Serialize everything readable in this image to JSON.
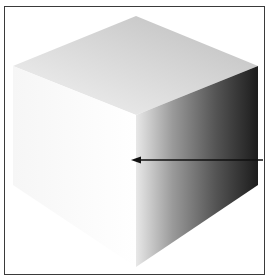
{
  "figure": {
    "faces": {
      "top": {
        "color_light": "#ececec",
        "color_dark": "#bdbdbd"
      },
      "left": {
        "color_light": "#ffffff",
        "color_dark": "#f2f2f2"
      },
      "right": {
        "color_light": "#e4e4e4",
        "color_dark": "#1e1e1e"
      }
    },
    "arrow": {
      "direction": "left",
      "color": "#111111"
    },
    "frame_color": "#3a3a3a"
  }
}
